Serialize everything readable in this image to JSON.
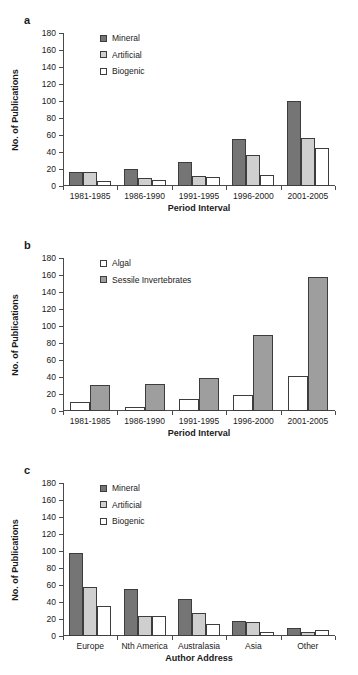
{
  "figure": {
    "panels": [
      "a",
      "b",
      "c"
    ]
  },
  "colors": {
    "mineral": "#757575",
    "artificial": "#cfcfcf",
    "biogenic": "#ffffff",
    "algal": "#ffffff",
    "sessile": "#9e9e9e",
    "axis": "#4a4a4a",
    "outline": "#3d3d3d"
  },
  "panel_a": {
    "letter": "a",
    "legend": [
      {
        "label": "Mineral",
        "key": "mineral"
      },
      {
        "label": "Artificial",
        "key": "artificial"
      },
      {
        "label": "Biogenic",
        "key": "biogenic"
      }
    ],
    "yticks": [
      "0",
      "20",
      "40",
      "60",
      "80",
      "100",
      "120",
      "140",
      "160",
      "180"
    ],
    "chart_data": {
      "type": "bar",
      "title": "",
      "xlabel": "Period Interval",
      "ylabel": "No. of Publications",
      "ylim": [
        0,
        180
      ],
      "ytick_step": 20,
      "grid": false,
      "legend_position": "top-left",
      "categories": [
        "1981-1985",
        "1986-1990",
        "1991-1995",
        "1996-2000",
        "2001-2005"
      ],
      "series": [
        {
          "name": "Mineral",
          "values": [
            17,
            20,
            28,
            55,
            100
          ]
        },
        {
          "name": "Artificial",
          "values": [
            16,
            10,
            12,
            37,
            56
          ]
        },
        {
          "name": "Biogenic",
          "values": [
            6,
            7,
            11,
            13,
            45
          ]
        }
      ]
    }
  },
  "panel_b": {
    "letter": "b",
    "legend": [
      {
        "label": "Algal",
        "key": "algal"
      },
      {
        "label": "Sessile Invertebrates",
        "key": "sessile"
      }
    ],
    "yticks": [
      "0",
      "20",
      "40",
      "60",
      "80",
      "100",
      "120",
      "140",
      "160",
      "180"
    ],
    "chart_data": {
      "type": "bar",
      "title": "",
      "xlabel": "Period Interval",
      "ylabel": "No. of Publications",
      "ylim": [
        0,
        180
      ],
      "ytick_step": 20,
      "grid": false,
      "legend_position": "top-left",
      "categories": [
        "1981-1985",
        "1986-1990",
        "1991-1995",
        "1996-2000",
        "2001-2005"
      ],
      "series": [
        {
          "name": "Algal",
          "values": [
            11,
            5,
            14,
            19,
            41
          ]
        },
        {
          "name": "Sessile Invertebrates",
          "values": [
            31,
            32,
            39,
            89,
            158
          ]
        }
      ]
    }
  },
  "panel_c": {
    "letter": "c",
    "legend": [
      {
        "label": "Mineral",
        "key": "mineral"
      },
      {
        "label": "Artificial",
        "key": "artificial"
      },
      {
        "label": "Biogenic",
        "key": "biogenic"
      }
    ],
    "yticks": [
      "0",
      "20",
      "40",
      "60",
      "80",
      "100",
      "120",
      "140",
      "160",
      "180"
    ],
    "chart_data": {
      "type": "bar",
      "title": "",
      "xlabel": "Author Address",
      "ylabel": "No. of Publications",
      "ylim": [
        0,
        180
      ],
      "ytick_step": 20,
      "grid": false,
      "legend_position": "top-left",
      "categories": [
        "Europe",
        "Nth America",
        "Australasia",
        "Asia",
        "Other"
      ],
      "series": [
        {
          "name": "Mineral",
          "values": [
            98,
            55,
            44,
            18,
            10
          ]
        },
        {
          "name": "Artificial",
          "values": [
            58,
            24,
            27,
            16,
            5
          ]
        },
        {
          "name": "Biogenic",
          "values": [
            35,
            24,
            14,
            5,
            7
          ]
        }
      ]
    }
  }
}
